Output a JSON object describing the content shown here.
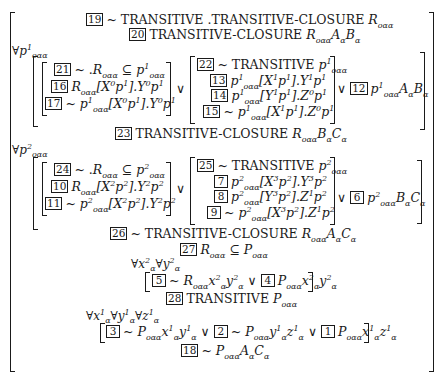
{
  "proof": {
    "l19": {
      "num": "19",
      "text": "~ TRANSITIVE .TRANSITIVE-CLOSURE R",
      "sub": "oαα"
    },
    "l20": {
      "num": "20",
      "text": "TRANSITIVE-CLOSURE R",
      "sub": "oαα",
      "tail": "A_α B_α"
    },
    "forall1": {
      "text": "∀p",
      "sup": "1",
      "sub": "oαα"
    },
    "left1": [
      {
        "num": "21",
        "text": "~ .R_oαα ⊆ p¹_oαα"
      },
      {
        "num": "16",
        "text": "R_oαα[X⁰p¹].Y⁰p¹"
      },
      {
        "num": "17",
        "text": "~ p¹_oαα[X⁰p¹].Y⁰p¹"
      }
    ],
    "right1": [
      {
        "num": "22",
        "text": "~ TRANSITIVE p¹_oαα"
      },
      {
        "num": "13",
        "text": "p¹_oαα[X¹p¹].Y¹p¹"
      },
      {
        "num": "14",
        "text": "p¹_oαα[Y¹p¹].Z⁰p¹"
      },
      {
        "num": "15",
        "text": "~ p¹_oαα[X¹p¹].Z⁰p¹"
      }
    ],
    "or": "∨",
    "tail1": {
      "num": "12",
      "text": "p¹_oαα A_α B_α"
    },
    "l23": {
      "num": "23",
      "text": "TRANSITIVE-CLOSURE R_oαα B_α C_α"
    },
    "forall2": {
      "text": "∀p",
      "sup": "2",
      "sub": "oαα"
    },
    "left2": [
      {
        "num": "24",
        "text": "~ .R_oαα ⊆ p²_oαα"
      },
      {
        "num": "10",
        "text": "R_oαα[X²p²].Y²p²"
      },
      {
        "num": "11",
        "text": "~ p²_oαα[X²p²].Y²p²"
      }
    ],
    "right2": [
      {
        "num": "25",
        "text": "~ TRANSITIVE p²_oαα"
      },
      {
        "num": "7",
        "text": "p²_oαα[X³p²].Y³p²"
      },
      {
        "num": "8",
        "text": "p²_oαα[Y³p²].Z¹p²"
      },
      {
        "num": "9",
        "text": "~ p²_oαα[X³p²].Z¹p²"
      }
    ],
    "tail2": {
      "num": "6",
      "text": "p²_oαα B_α C_α"
    },
    "l26": {
      "num": "26",
      "text": "~ TRANSITIVE-CLOSURE R_oαα A_α C_α"
    },
    "l27": {
      "num": "27",
      "text": "R_oαα ⊆ P_oαα"
    },
    "forall3": {
      "text": "∀x²_α ∀y²_α"
    },
    "l5_4": {
      "num_a": "5",
      "text_a": "~ R_oαα x²_α y²_α",
      "num_b": "4",
      "text_b": "P_oαα x²_α y²_α"
    },
    "l28": {
      "num": "28",
      "text": "TRANSITIVE P_oαα"
    },
    "forall4": {
      "text": "∀x¹_α ∀y¹_α ∀z¹_α"
    },
    "l3_2_1": {
      "num_a": "3",
      "text_a": "~ P_oαα x¹_α y¹_α",
      "num_b": "2",
      "text_b": "~ P_oαα y¹_α z¹_α",
      "num_c": "1",
      "text_c": "P_oαα x¹_α z¹_α"
    },
    "l18": {
      "num": "18",
      "text": "~ P_oαα A_α C_α"
    }
  }
}
